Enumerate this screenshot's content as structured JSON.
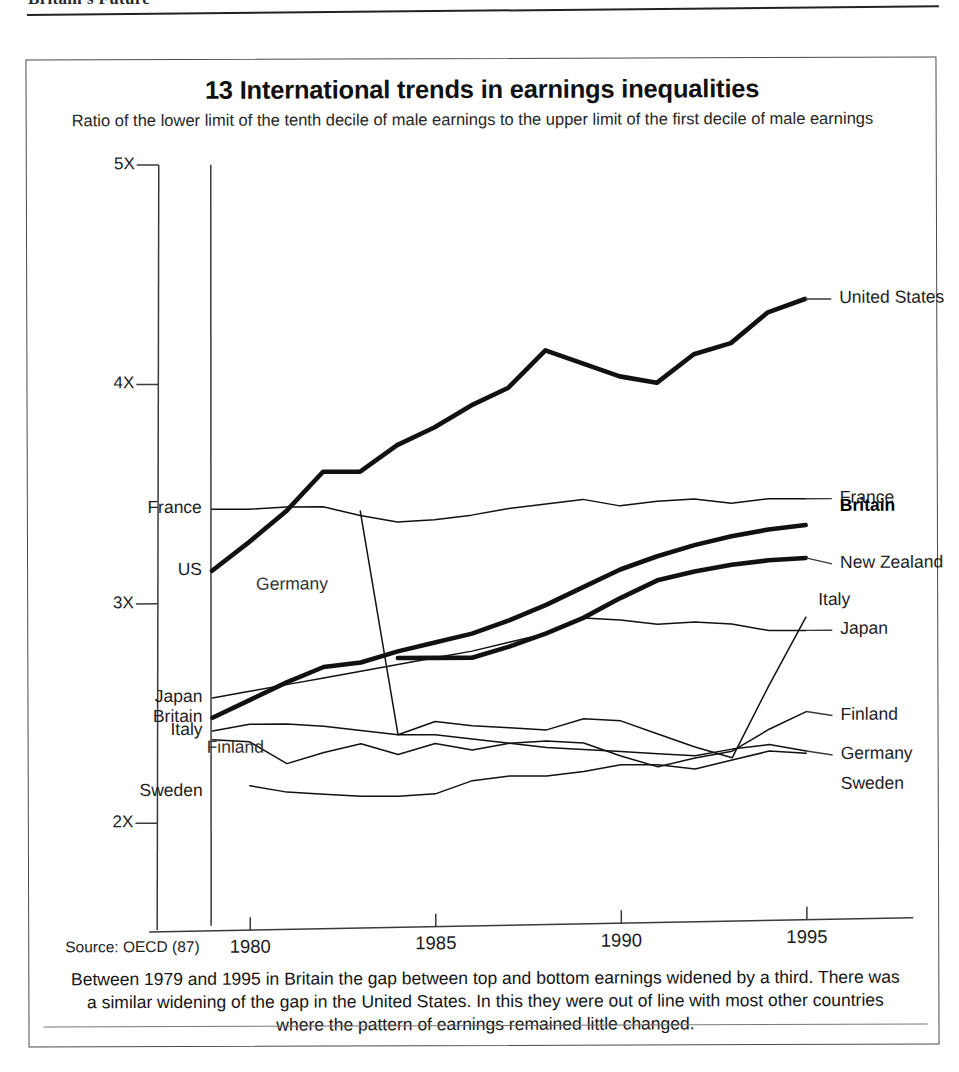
{
  "page_header": "Britain's Future",
  "figure": {
    "title": "13 International trends in earnings inequalities",
    "subtitle": "Ratio of the lower limit of the tenth decile of male earnings to the upper limit of the first decile of male earnings",
    "source": "Source: OECD (87)",
    "caption": "Between 1979 and 1995 in Britain the gap between top and bottom earnings widened by a third. There was a similar widening of the gap in the United States. In this they were out of line with most other countries where the pattern of earnings remained little changed."
  },
  "labels": {
    "left": [
      {
        "name": "France",
        "text": "France"
      },
      {
        "name": "US",
        "text": "US"
      },
      {
        "name": "Japan",
        "text": "Japan"
      },
      {
        "name": "Britain",
        "text": "Britain"
      },
      {
        "name": "Italy",
        "text": "Italy"
      },
      {
        "name": "Sweden",
        "text": "Sweden"
      }
    ],
    "right": [
      {
        "name": "United States",
        "text": "United States"
      },
      {
        "name": "France",
        "text": "France"
      },
      {
        "name": "Britain",
        "text": "Britain"
      },
      {
        "name": "New Zealand",
        "text": "New Zealand"
      },
      {
        "name": "Japan",
        "text": "Japan"
      },
      {
        "name": "Italy",
        "text": "Italy"
      },
      {
        "name": "Finland",
        "text": "Finland"
      },
      {
        "name": "Germany",
        "text": "Germany"
      },
      {
        "name": "Sweden",
        "text": "Sweden"
      }
    ],
    "inner": [
      {
        "name": "Germany",
        "text": "Germany"
      },
      {
        "name": "Finland",
        "text": "Finland"
      }
    ]
  },
  "chart_data": {
    "type": "line",
    "title": "13 International trends in earnings inequalities",
    "subtitle": "Ratio of the lower limit of the tenth decile of male earnings to the upper limit of the first decile of male earnings",
    "xlabel": "",
    "ylabel": "",
    "xlim": [
      1978.3,
      1995.6
    ],
    "ylim": [
      1.55,
      5.0
    ],
    "xticks": [
      1980,
      1985,
      1990,
      1995
    ],
    "xtick_labels": [
      "1980",
      "1985",
      "1990",
      "1995"
    ],
    "yticks": [
      2,
      3,
      4,
      5
    ],
    "ytick_labels": [
      "2X",
      "3X",
      "4X",
      "5X"
    ],
    "grid": false,
    "legend": "inline-end-labels",
    "series": [
      {
        "name": "United States",
        "emphasis": "bold",
        "x": [
          1979,
          1980,
          1981,
          1982,
          1983,
          1984,
          1985,
          1986,
          1987,
          1988,
          1989,
          1990,
          1991,
          1992,
          1993,
          1994,
          1995
        ],
        "values": [
          3.15,
          3.28,
          3.42,
          3.6,
          3.6,
          3.72,
          3.8,
          3.9,
          3.98,
          4.15,
          4.09,
          4.03,
          4.0,
          4.13,
          4.18,
          4.32,
          4.38
        ]
      },
      {
        "name": "France",
        "emphasis": "thin",
        "x": [
          1979,
          1980,
          1981,
          1982,
          1983,
          1984,
          1985,
          1986,
          1987,
          1988,
          1989,
          1990,
          1991,
          1992,
          1993,
          1994,
          1995
        ],
        "values": [
          3.43,
          3.43,
          3.44,
          3.44,
          3.4,
          3.37,
          3.38,
          3.4,
          3.43,
          3.45,
          3.47,
          3.44,
          3.46,
          3.47,
          3.45,
          3.47,
          3.47
        ]
      },
      {
        "name": "Britain",
        "emphasis": "bold",
        "x": [
          1979,
          1980,
          1981,
          1982,
          1983,
          1984,
          1985,
          1986,
          1987,
          1988,
          1989,
          1990,
          1991,
          1992,
          1993,
          1994,
          1995
        ],
        "values": [
          2.48,
          2.56,
          2.64,
          2.71,
          2.73,
          2.78,
          2.82,
          2.86,
          2.92,
          2.99,
          3.07,
          3.15,
          3.21,
          3.26,
          3.3,
          3.33,
          3.35
        ]
      },
      {
        "name": "New Zealand",
        "emphasis": "bold",
        "x": [
          1984,
          1985,
          1986,
          1987,
          1988,
          1989,
          1990,
          1991,
          1992,
          1993,
          1994,
          1995
        ],
        "values": [
          2.75,
          2.75,
          2.75,
          2.8,
          2.86,
          2.93,
          3.02,
          3.1,
          3.14,
          3.17,
          3.19,
          3.2
        ]
      },
      {
        "name": "Japan",
        "emphasis": "thin",
        "x": [
          1979,
          1980,
          1981,
          1982,
          1983,
          1984,
          1985,
          1986,
          1987,
          1988,
          1989,
          1990,
          1991,
          1992,
          1993,
          1994,
          1995
        ],
        "values": [
          2.57,
          2.6,
          2.63,
          2.66,
          2.69,
          2.72,
          2.75,
          2.78,
          2.82,
          2.86,
          2.93,
          2.92,
          2.9,
          2.91,
          2.9,
          2.87,
          2.87
        ]
      },
      {
        "name": "Italy",
        "emphasis": "thin",
        "x": [
          1979,
          1980,
          1981,
          1982,
          1983,
          1984,
          1985,
          1986,
          1987,
          1988,
          1989,
          1990,
          1991,
          1992,
          1993,
          1994,
          1995
        ],
        "values": [
          2.42,
          2.45,
          2.45,
          2.44,
          2.42,
          2.4,
          2.46,
          2.44,
          2.43,
          2.42,
          2.47,
          2.46,
          2.4,
          2.34,
          2.29,
          2.62,
          2.93
        ]
      },
      {
        "name": "Finland",
        "emphasis": "thin",
        "x": [
          1979,
          1980,
          1981,
          1982,
          1983,
          1984,
          1985,
          1986,
          1987,
          1988,
          1989,
          1990,
          1991,
          1992,
          1993,
          1994,
          1995
        ],
        "values": [
          2.38,
          2.37,
          2.27,
          2.32,
          2.36,
          2.31,
          2.36,
          2.33,
          2.36,
          2.37,
          2.36,
          2.3,
          2.25,
          2.29,
          2.32,
          2.42,
          2.5
        ]
      },
      {
        "name": "Germany",
        "emphasis": "thin",
        "x": [
          1983,
          1984,
          1985,
          1986,
          1987,
          1988,
          1989,
          1990,
          1991,
          1992,
          1993,
          1994,
          1995
        ],
        "values": [
          3.42,
          2.4,
          2.4,
          2.38,
          2.36,
          2.34,
          2.33,
          2.32,
          2.31,
          2.3,
          2.33,
          2.35,
          2.32
        ]
      },
      {
        "name": "Sweden",
        "emphasis": "thin",
        "x": [
          1980,
          1981,
          1982,
          1983,
          1984,
          1985,
          1986,
          1987,
          1988,
          1989,
          1990,
          1991,
          1992,
          1993,
          1994,
          1995
        ],
        "values": [
          2.17,
          2.14,
          2.13,
          2.12,
          2.12,
          2.13,
          2.19,
          2.21,
          2.21,
          2.23,
          2.26,
          2.26,
          2.24,
          2.28,
          2.32,
          2.31
        ]
      }
    ]
  }
}
